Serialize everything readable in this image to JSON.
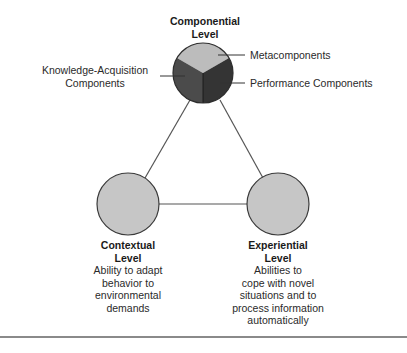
{
  "diagram": {
    "type": "triarchic-theory-of-intelligence",
    "colors": {
      "metacomponents": "#bcbcbc",
      "knowledge_acquisition": "#4b4b4b",
      "performance": "#343434",
      "level_circle_fill": "#c6c6c6",
      "outline": "#3a3a3a",
      "connector": "#555555"
    },
    "nodes": {
      "componential": {
        "title_line1": "Componential",
        "title_line2": "Level",
        "segments": [
          {
            "label": "Metacomponents"
          },
          {
            "label_line1": "Knowledge-Acquisition",
            "label_line2": "Components"
          },
          {
            "label": "Performance Components"
          }
        ]
      },
      "contextual": {
        "title_line1": "Contextual",
        "title_line2": "Level",
        "description": [
          "Ability to adapt",
          "behavior to",
          "environmental",
          "demands"
        ]
      },
      "experiential": {
        "title_line1": "Experiential",
        "title_line2": "Level",
        "description": [
          "Abilities to",
          "cope with novel",
          "situations and to",
          "process information",
          "automatically"
        ]
      }
    }
  }
}
